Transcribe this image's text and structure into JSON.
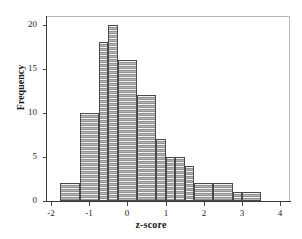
{
  "chart_data": {
    "type": "bar",
    "title": "",
    "subtitle": "",
    "xlabel": "z-score",
    "ylabel": "Frequency",
    "xlim": [
      -2.1,
      4.25
    ],
    "ylim": [
      0,
      21
    ],
    "grid": false,
    "legend": null,
    "bin_width": 0.25,
    "bin_left_edges": [
      -1.75,
      -1.5,
      -1.25,
      -1.0,
      -0.75,
      -0.5,
      -0.25,
      0.0,
      0.25,
      0.5,
      0.75,
      1.0,
      1.25,
      1.5,
      1.75,
      2.0,
      2.25,
      2.5,
      2.75,
      3.0,
      3.25
    ],
    "categories": [
      "-1.75",
      "-1.5",
      "-1.25",
      "-1.0",
      "-0.75",
      "-0.5",
      "-0.25",
      "0.0",
      "0.25",
      "0.5",
      "0.75",
      "1.0",
      "1.25",
      "1.5",
      "1.75",
      "2.0",
      "2.25",
      "2.5",
      "2.75",
      "3.0",
      "3.25"
    ],
    "values": [
      2,
      2,
      10,
      10,
      18,
      18,
      20,
      20,
      16,
      16,
      12,
      12,
      7,
      7,
      5,
      4,
      4,
      2,
      2,
      1,
      1
    ],
    "bars": [
      {
        "x0": -1.75,
        "x1": -1.25,
        "height": 2
      },
      {
        "x0": -1.25,
        "x1": -0.75,
        "height": 10
      },
      {
        "x0": -0.75,
        "x1": -0.5,
        "height": 18
      },
      {
        "x0": -0.5,
        "x1": -0.25,
        "height": 20
      },
      {
        "x0": -0.25,
        "x1": 0.25,
        "height": 16
      },
      {
        "x0": 0.25,
        "x1": 0.75,
        "height": 12
      },
      {
        "x0": 0.75,
        "x1": 1.0,
        "height": 7
      },
      {
        "x0": 1.0,
        "x1": 1.25,
        "height": 5
      },
      {
        "x0": 1.25,
        "x1": 1.5,
        "height": 5
      },
      {
        "x0": 1.5,
        "x1": 1.75,
        "height": 4
      },
      {
        "x0": 1.75,
        "x1": 2.25,
        "height": 2
      },
      {
        "x0": 2.25,
        "x1": 2.75,
        "height": 2
      },
      {
        "x0": 2.75,
        "x1": 3.0,
        "height": 1
      },
      {
        "x0": 3.0,
        "x1": 3.5,
        "height": 1
      }
    ],
    "y_ticks": [
      0,
      5,
      10,
      15,
      20
    ],
    "y_tick_labels": [
      "0",
      "5",
      "10",
      "15",
      "20"
    ],
    "x_ticks": [
      -2,
      -1,
      0,
      1,
      2,
      3,
      4
    ],
    "x_tick_labels": [
      "-2",
      "-1",
      "0",
      "1",
      "2",
      "3",
      "4"
    ],
    "colors": {
      "bar_fill": "#b0b0b0",
      "bar_edge": "#4a4a4a",
      "axis": "#3a3a3a",
      "frame": "#b9b9b9",
      "text": "#232323",
      "background": "#ffffff"
    }
  }
}
